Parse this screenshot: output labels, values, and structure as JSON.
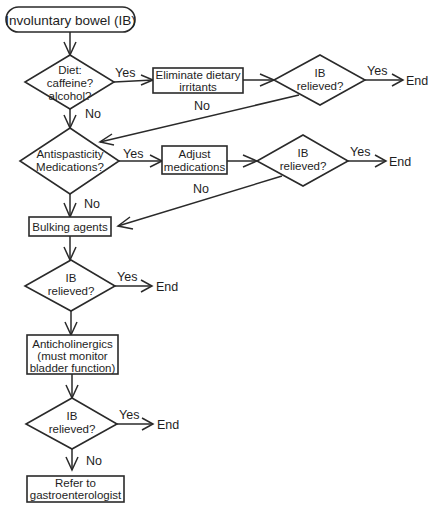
{
  "diagram": {
    "type": "flowchart",
    "start": {
      "label": "Involuntary bowel (IB)"
    },
    "nodes": {
      "diet_decision": {
        "lines": [
          "Diet:",
          "caffeine?",
          "alcohol?"
        ]
      },
      "eliminate_box": {
        "lines": [
          "Eliminate dietary",
          "irritants"
        ]
      },
      "relieved_1": {
        "lines": [
          "IB",
          "relieved?"
        ]
      },
      "antispasticity_decision": {
        "lines": [
          "Antispasticity",
          "Medications?"
        ]
      },
      "adjust_box": {
        "lines": [
          "Adjust",
          "medications"
        ]
      },
      "relieved_2": {
        "lines": [
          "IB",
          "relieved?"
        ]
      },
      "bulking_box": {
        "lines": [
          "Bulking agents"
        ]
      },
      "relieved_3": {
        "lines": [
          "IB",
          "relieved?"
        ]
      },
      "anticholinergics_box": {
        "lines": [
          "Anticholinergics",
          "(must monitor",
          "bladder function)"
        ]
      },
      "relieved_4": {
        "lines": [
          "IB",
          "relieved?"
        ]
      },
      "refer_box": {
        "lines": [
          "Refer to",
          "gastroenterologist"
        ]
      }
    },
    "edge_labels": {
      "yes": "Yes",
      "no": "No",
      "end": "End"
    },
    "edges": [
      {
        "from": "start",
        "to": "diet_decision",
        "label": ""
      },
      {
        "from": "diet_decision",
        "to": "eliminate_box",
        "label": "Yes"
      },
      {
        "from": "eliminate_box",
        "to": "relieved_1",
        "label": ""
      },
      {
        "from": "relieved_1",
        "to": "End",
        "label": "Yes"
      },
      {
        "from": "relieved_1",
        "to": "antispasticity_decision",
        "label": "No"
      },
      {
        "from": "diet_decision",
        "to": "antispasticity_decision",
        "label": "No"
      },
      {
        "from": "antispasticity_decision",
        "to": "adjust_box",
        "label": "Yes"
      },
      {
        "from": "adjust_box",
        "to": "relieved_2",
        "label": ""
      },
      {
        "from": "relieved_2",
        "to": "End",
        "label": "Yes"
      },
      {
        "from": "relieved_2",
        "to": "bulking_box",
        "label": "No"
      },
      {
        "from": "antispasticity_decision",
        "to": "bulking_box",
        "label": "No"
      },
      {
        "from": "bulking_box",
        "to": "relieved_3",
        "label": ""
      },
      {
        "from": "relieved_3",
        "to": "End",
        "label": "Yes"
      },
      {
        "from": "relieved_3",
        "to": "anticholinergics_box",
        "label": ""
      },
      {
        "from": "anticholinergics_box",
        "to": "relieved_4",
        "label": ""
      },
      {
        "from": "relieved_4",
        "to": "End",
        "label": "Yes"
      },
      {
        "from": "relieved_4",
        "to": "refer_box",
        "label": "No"
      }
    ]
  }
}
